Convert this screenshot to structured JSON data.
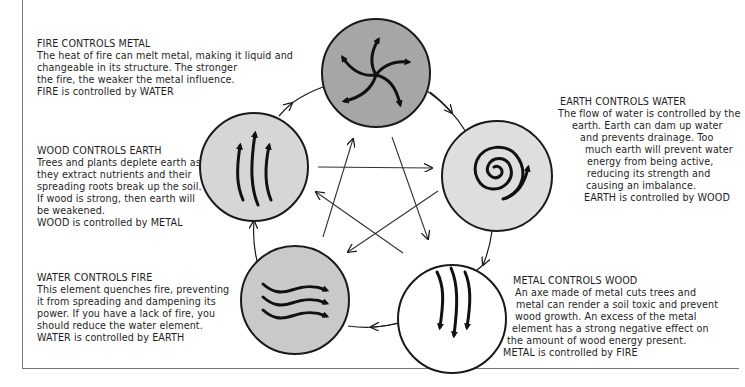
{
  "diagram": {
    "type": "five-elements-control-cycle",
    "colors": {
      "fire_fill": "#a6a6a6",
      "earth_fill": "#dedede",
      "metal_fill": "#ffffff",
      "water_fill": "#c9c9c9",
      "wood_fill": "#d6d6d6",
      "stroke": "#1a1a1a",
      "frame": "#777777"
    },
    "elements": [
      {
        "name": "Fire",
        "icon": "swirl-arrows-icon",
        "cx": 376,
        "cy": 73
      },
      {
        "name": "Earth",
        "icon": "spiral-icon",
        "cx": 497,
        "cy": 176
      },
      {
        "name": "Metal",
        "icon": "down-arrows-icon",
        "cx": 452,
        "cy": 319
      },
      {
        "name": "Water",
        "icon": "wave-arrows-icon",
        "cx": 295,
        "cy": 300
      },
      {
        "name": "Wood",
        "icon": "up-arrows-icon",
        "cx": 254,
        "cy": 167
      }
    ],
    "outer_cycle": [
      "Fire",
      "Earth",
      "Metal",
      "Water",
      "Wood",
      "Fire"
    ],
    "inner_star": [
      {
        "from": "Water",
        "to": "Fire"
      },
      {
        "from": "Fire",
        "to": "Metal"
      },
      {
        "from": "Metal",
        "to": "Wood"
      },
      {
        "from": "Wood",
        "to": "Earth"
      },
      {
        "from": "Earth",
        "to": "Water"
      }
    ]
  },
  "fire": {
    "title": "FIRE CONTROLS METAL",
    "lines": [
      "The heat of fire can melt metal, making it liquid and",
      "changeable in its structure. The stronger",
      "the fire, the weaker the metal influence.",
      "FIRE is controlled by WATER"
    ]
  },
  "wood": {
    "title": "WOOD CONTROLS EARTH",
    "lines": [
      "Trees and plants deplete earth as",
      "they extract nutrients and their",
      "spreading roots break up the soil.",
      "If wood is strong, then earth will",
      "be weakened.",
      "WOOD is controlled by METAL"
    ]
  },
  "water": {
    "title": "WATER CONTROLS FIRE",
    "lines": [
      "This element quenches fire, preventing",
      "it from spreading and dampening its",
      "power. If you have a lack of fire, you",
      "should reduce the water element.",
      "WATER is controlled by EARTH"
    ]
  },
  "earth": {
    "title": "EARTH CONTROLS WATER",
    "lines": [
      "The flow of water is controlled by the",
      "earth. Earth can dam up water",
      "and prevents drainage. Too",
      "much earth will prevent water",
      "energy from being active,",
      "reducing its strength and",
      "causing an imbalance.",
      "EARTH is controlled by WOOD"
    ]
  },
  "metal": {
    "title": "METAL CONTROLS WOOD",
    "lines": [
      "An axe made of metal cuts trees and",
      "metal can render a soil toxic and prevent",
      "wood growth. An excess of the metal",
      "element has a strong negative effect on",
      "the amount of wood energy present.",
      "METAL is controlled by FIRE"
    ]
  }
}
